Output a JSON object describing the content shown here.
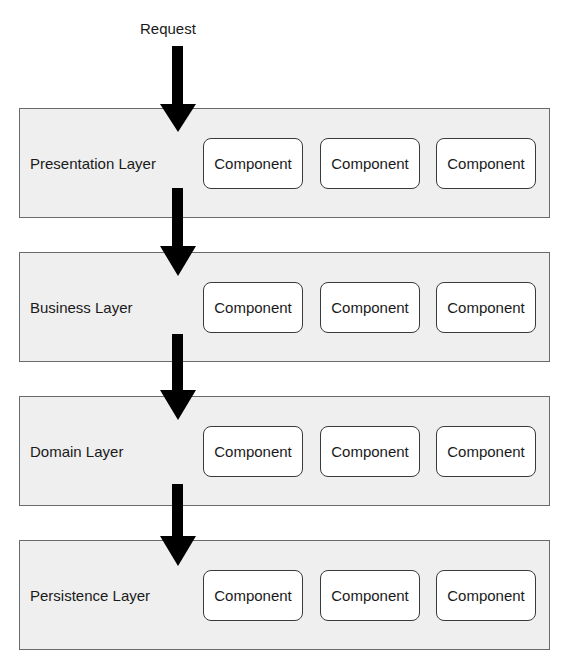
{
  "diagram": {
    "request_label": "Request",
    "layers": [
      {
        "label": "Presentation Layer",
        "components": [
          "Component",
          "Component",
          "Component"
        ]
      },
      {
        "label": "Business Layer",
        "components": [
          "Component",
          "Component",
          "Component"
        ]
      },
      {
        "label": "Domain Layer",
        "components": [
          "Component",
          "Component",
          "Component"
        ]
      },
      {
        "label": "Persistence Layer",
        "components": [
          "Component",
          "Component",
          "Component"
        ]
      }
    ],
    "colors": {
      "layer_fill": "#efefef",
      "layer_border": "#6a6a6a",
      "component_fill": "#ffffff",
      "component_border": "#3a3a3a",
      "arrow": "#000000"
    }
  }
}
